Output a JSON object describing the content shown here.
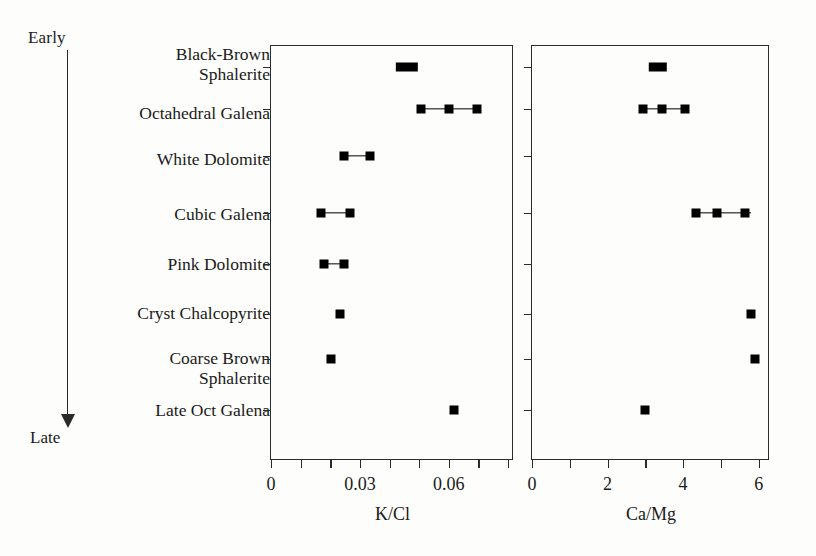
{
  "figure": {
    "early_label": "Early",
    "late_label": "Late"
  },
  "chart_data": {
    "type": "scatter",
    "title": "",
    "subtitle": "",
    "categories": [
      "Black-Brown\nSphalerite",
      "Octahedral Galena",
      "White Dolomite",
      "Cubic Galena",
      "Pink Dolomite",
      "Cryst Chalcopyrite",
      "Coarse Brown\nSphalerite",
      "Late Oct Galena"
    ],
    "ylabel": "Paragenetic sequence (Early to Late)",
    "grid": false,
    "legend": "none",
    "panels": [
      {
        "name": "kcl",
        "xlabel": "K/Cl",
        "xlim": [
          0,
          0.082
        ],
        "xticks": [
          0,
          0.01,
          0.02,
          0.03,
          0.04,
          0.05,
          0.06,
          0.07,
          0.08
        ],
        "xticklabels": [
          "0",
          "",
          "",
          "0.03",
          "",
          "",
          "0.06",
          "",
          ""
        ],
        "rows": [
          {
            "category": "Black-Brown Sphalerite",
            "points": [
              0.0435,
              0.048
            ],
            "range": [
              0.0425,
              0.049
            ]
          },
          {
            "category": "Octahedral Galena",
            "points": [
              0.0505,
              0.06,
              0.0695
            ],
            "range": [
              0.0505,
              0.0695
            ]
          },
          {
            "category": "White Dolomite",
            "points": [
              0.0248,
              0.0335
            ],
            "range": [
              0.0248,
              0.0335
            ]
          },
          {
            "category": "Cubic Galena",
            "points": [
              0.0168,
              0.0265
            ],
            "range": [
              0.0168,
              0.0265
            ]
          },
          {
            "category": "Pink Dolomite",
            "points": [
              0.018,
              0.0248
            ],
            "range": [
              0.018,
              0.0248
            ]
          },
          {
            "category": "Cryst Chalcopyrite",
            "points": [
              0.0232
            ],
            "range": null
          },
          {
            "category": "Coarse Brown Sphalerite",
            "points": [
              0.0202
            ],
            "range": null
          },
          {
            "category": "Late Oct Galena",
            "points": [
              0.0618
            ],
            "range": null
          }
        ]
      },
      {
        "name": "camg",
        "xlabel": "Ca/Mg",
        "xlim": [
          0,
          6.3
        ],
        "xticks": [
          0,
          1,
          2,
          3,
          4,
          5,
          6
        ],
        "xticklabels": [
          "0",
          "",
          "2",
          "",
          "4",
          "",
          "6"
        ],
        "rows": [
          {
            "category": "Black-Brown Sphalerite",
            "points": [
              3.2,
              3.45
            ],
            "range": [
              3.15,
              3.5
            ]
          },
          {
            "category": "Octahedral Galena",
            "points": [
              2.95,
              3.45,
              4.05
            ],
            "range": [
              2.95,
              4.15
            ]
          },
          {
            "category": "White Dolomite",
            "points": [],
            "range": null
          },
          {
            "category": "Cubic Galena",
            "points": [
              4.35,
              4.9,
              5.65
            ],
            "range": [
              4.35,
              5.8
            ]
          },
          {
            "category": "Pink Dolomite",
            "points": [],
            "range": null
          },
          {
            "category": "Cryst Chalcopyrite",
            "points": [
              5.8
            ],
            "range": null
          },
          {
            "category": "Coarse Brown Sphalerite",
            "points": [
              5.9
            ],
            "range": null
          },
          {
            "category": "Late Oct Galena",
            "points": [
              3.0
            ],
            "range": null
          }
        ]
      }
    ]
  }
}
